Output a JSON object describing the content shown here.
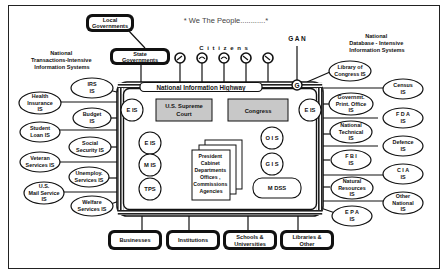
{
  "title": "* We The People............*",
  "citizens_label": "C i t i z e n s",
  "gan_label": "G A N",
  "g_label": "G",
  "highway_label": "National Information Highway",
  "left_group_title": [
    "National",
    "Transactions-Intensive",
    "Information Systems"
  ],
  "right_group_title": [
    "National",
    "Database - Intensive",
    "Information Systems"
  ],
  "top_boxes": {
    "local": [
      "Local",
      "Governments"
    ],
    "state": [
      "State",
      "Governments"
    ]
  },
  "inner": {
    "court": [
      "U.S. Supreme",
      "Court"
    ],
    "congress": "Congress",
    "eis_top_left": "E IS",
    "eis_top_right": "E IS",
    "eis_mid": "E IS",
    "mis": "M IS",
    "tps": "TPS",
    "ois": "O I S",
    "gis": "G I S",
    "mdss": "M DSS",
    "center": [
      "President",
      "Cabinet",
      "Departments",
      "Offices ,",
      "Commissions",
      "Agencies"
    ]
  },
  "left_systems": [
    {
      "lines": [
        "IRS",
        "IS"
      ]
    },
    {
      "lines": [
        "Health",
        "Insurance",
        "IS"
      ]
    },
    {
      "lines": [
        "Budget",
        "IS"
      ]
    },
    {
      "lines": [
        "Student",
        "Loan IS"
      ]
    },
    {
      "lines": [
        "Social",
        "Security IS"
      ]
    },
    {
      "lines": [
        "Veteran",
        "Services IS"
      ]
    },
    {
      "lines": [
        "Unemploy.",
        "Services IS"
      ]
    },
    {
      "lines": [
        "U.S.",
        "Mail Service",
        "IS"
      ]
    },
    {
      "lines": [
        "Welfare",
        "Services IS"
      ]
    }
  ],
  "right_systems": [
    {
      "lines": [
        "Library of",
        "Congress IS"
      ]
    },
    {
      "lines": [
        "Census",
        "IS"
      ]
    },
    {
      "lines": [
        "Governmt.",
        "Print. Office",
        "IS"
      ]
    },
    {
      "lines": [
        "F D A",
        "IS"
      ]
    },
    {
      "lines": [
        "National",
        "Technical",
        "IS"
      ]
    },
    {
      "lines": [
        "Defence",
        "IS"
      ]
    },
    {
      "lines": [
        "F B I",
        "IS"
      ]
    },
    {
      "lines": [
        "C I A",
        "IS"
      ]
    },
    {
      "lines": [
        "Natural",
        "Resources",
        "IS"
      ]
    },
    {
      "lines": [
        "Other",
        "National",
        "IS"
      ]
    },
    {
      "lines": [
        "E P A",
        "IS"
      ]
    }
  ],
  "bottom_boxes": [
    {
      "lines": [
        "Businesses"
      ]
    },
    {
      "lines": [
        "Institutions"
      ]
    },
    {
      "lines": [
        "Schools &",
        "Universities"
      ]
    },
    {
      "lines": [
        "Libraries &",
        "Other"
      ]
    }
  ]
}
